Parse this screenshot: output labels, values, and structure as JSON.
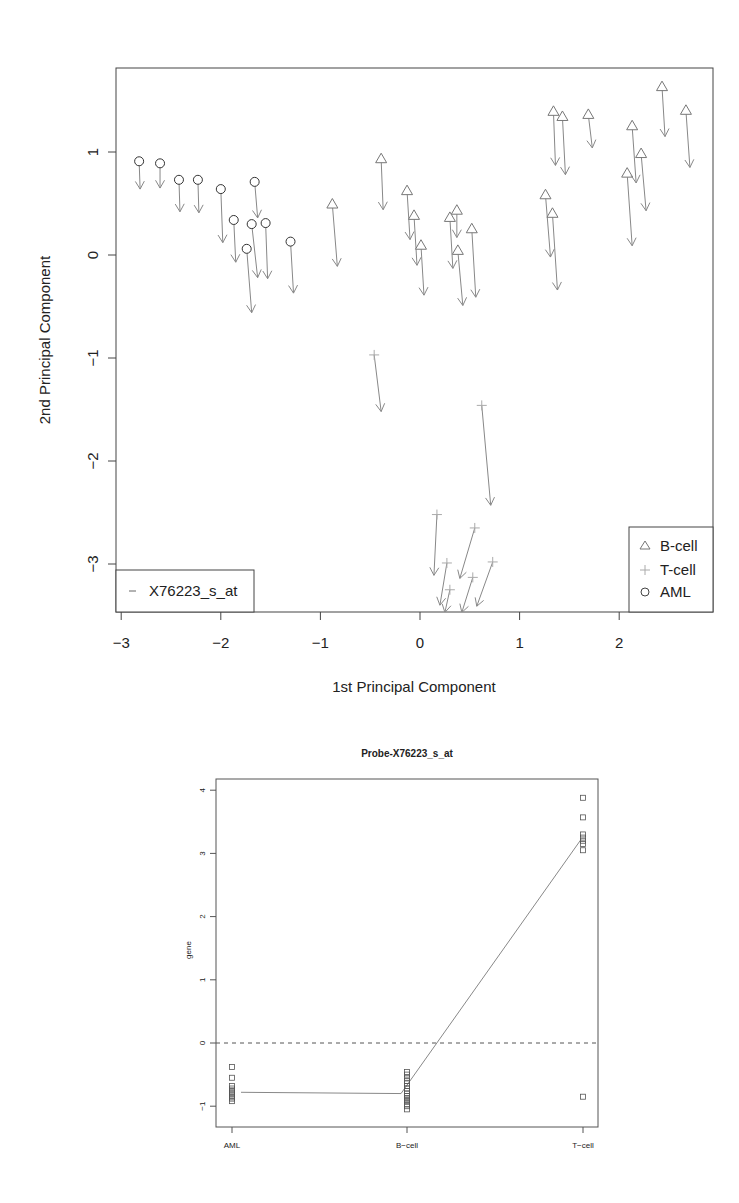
{
  "chart_data": [
    {
      "type": "scatter",
      "subtype": "arrow-displacement",
      "title": "",
      "xlabel": "1st Principal Component",
      "ylabel": "2nd Principal Component",
      "xlim": [
        -3.05,
        2.95
      ],
      "ylim": [
        -3.47,
        1.83
      ],
      "xticks": [
        -3,
        -2,
        -1,
        0,
        1,
        2
      ],
      "yticks": [
        1,
        0,
        -1,
        -2,
        -3
      ],
      "grid": false,
      "legends": [
        {
          "placement": "bottom-right",
          "entries": [
            {
              "label": "B-cell",
              "marker": "triangle"
            },
            {
              "label": "T-cell",
              "marker": "plus"
            },
            {
              "label": "AML",
              "marker": "circle"
            }
          ]
        },
        {
          "placement": "bottom-left",
          "entries": [
            {
              "label": "X76223_s_at",
              "marker": "dash"
            }
          ]
        }
      ],
      "series": [
        {
          "name": "AML",
          "marker": "circle",
          "points": [
            {
              "x": -2.82,
              "y": 0.91,
              "x2": -2.81,
              "y2": 0.64
            },
            {
              "x": -2.61,
              "y": 0.89,
              "x2": -2.61,
              "y2": 0.65
            },
            {
              "x": -2.42,
              "y": 0.73,
              "x2": -2.41,
              "y2": 0.42
            },
            {
              "x": -2.23,
              "y": 0.73,
              "x2": -2.22,
              "y2": 0.41
            },
            {
              "x": -2.0,
              "y": 0.64,
              "x2": -1.98,
              "y2": 0.12
            },
            {
              "x": -1.87,
              "y": 0.34,
              "x2": -1.85,
              "y2": -0.07
            },
            {
              "x": -1.66,
              "y": 0.71,
              "x2": -1.63,
              "y2": 0.36
            },
            {
              "x": -1.69,
              "y": 0.3,
              "x2": -1.63,
              "y2": -0.22
            },
            {
              "x": -1.55,
              "y": 0.31,
              "x2": -1.53,
              "y2": -0.23
            },
            {
              "x": -1.74,
              "y": 0.06,
              "x2": -1.69,
              "y2": -0.56
            },
            {
              "x": -1.3,
              "y": 0.13,
              "x2": -1.27,
              "y2": -0.37
            }
          ]
        },
        {
          "name": "B-cell",
          "marker": "triangle",
          "points": [
            {
              "x": -0.88,
              "y": 0.49,
              "x2": -0.83,
              "y2": -0.11
            },
            {
              "x": -0.39,
              "y": 0.93,
              "x2": -0.37,
              "y2": 0.44
            },
            {
              "x": -0.13,
              "y": 0.62,
              "x2": -0.1,
              "y2": 0.15
            },
            {
              "x": -0.06,
              "y": 0.38,
              "x2": -0.03,
              "y2": -0.1
            },
            {
              "x": 0.01,
              "y": 0.09,
              "x2": 0.04,
              "y2": -0.39
            },
            {
              "x": 0.3,
              "y": 0.36,
              "x2": 0.33,
              "y2": -0.13
            },
            {
              "x": 0.37,
              "y": 0.43,
              "x2": 0.37,
              "y2": 0.17
            },
            {
              "x": 0.38,
              "y": 0.04,
              "x2": 0.43,
              "y2": -0.49
            },
            {
              "x": 0.52,
              "y": 0.25,
              "x2": 0.56,
              "y2": -0.41
            },
            {
              "x": 1.34,
              "y": 1.39,
              "x2": 1.36,
              "y2": 0.87
            },
            {
              "x": 1.43,
              "y": 1.34,
              "x2": 1.46,
              "y2": 0.78
            },
            {
              "x": 1.69,
              "y": 1.36,
              "x2": 1.73,
              "y2": 1.04
            },
            {
              "x": 1.26,
              "y": 0.58,
              "x2": 1.31,
              "y2": -0.02
            },
            {
              "x": 1.33,
              "y": 0.4,
              "x2": 1.38,
              "y2": -0.34
            },
            {
              "x": 2.08,
              "y": 0.79,
              "x2": 2.13,
              "y2": 0.09
            },
            {
              "x": 2.13,
              "y": 1.25,
              "x2": 2.17,
              "y2": 0.7
            },
            {
              "x": 2.22,
              "y": 0.98,
              "x2": 2.27,
              "y2": 0.43
            },
            {
              "x": 2.43,
              "y": 1.63,
              "x2": 2.46,
              "y2": 1.15
            },
            {
              "x": 2.67,
              "y": 1.4,
              "x2": 2.71,
              "y2": 0.85
            }
          ]
        },
        {
          "name": "T-cell",
          "marker": "plus",
          "points": [
            {
              "x": -0.46,
              "y": -0.97,
              "x2": -0.39,
              "y2": -1.52
            },
            {
              "x": 0.62,
              "y": -1.46,
              "x2": 0.71,
              "y2": -2.43
            },
            {
              "x": 0.17,
              "y": -2.52,
              "x2": 0.14,
              "y2": -3.11
            },
            {
              "x": 0.27,
              "y": -2.99,
              "x2": 0.2,
              "y2": -3.4
            },
            {
              "x": 0.55,
              "y": -2.65,
              "x2": 0.4,
              "y2": -3.14
            },
            {
              "x": 0.73,
              "y": -2.98,
              "x2": 0.57,
              "y2": -3.41
            },
            {
              "x": 0.3,
              "y": -3.25,
              "x2": 0.25,
              "y2": -3.47
            },
            {
              "x": 0.53,
              "y": -3.13,
              "x2": 0.42,
              "y2": -3.47
            }
          ]
        }
      ]
    },
    {
      "type": "scatter",
      "subtype": "strip-with-mean-line",
      "title": "Probe-X76223_s_at",
      "xlabel": "",
      "ylabel": "gene",
      "categories": [
        "AML",
        "B-cell",
        "T-cell"
      ],
      "ylim": [
        -1.25,
        4.15
      ],
      "yticks": [
        4,
        3,
        2,
        1,
        0,
        -1
      ],
      "grid": false,
      "reference_line": {
        "y": 0,
        "style": "dashed"
      },
      "means": [
        -0.78,
        -0.8,
        3.22
      ],
      "series": [
        {
          "name": "AML",
          "values": [
            -0.38,
            -0.55,
            -0.68,
            -0.72,
            -0.75,
            -0.78,
            -0.8,
            -0.83,
            -0.86,
            -0.88,
            -0.92
          ]
        },
        {
          "name": "B-cell",
          "values": [
            -0.46,
            -0.5,
            -0.55,
            -0.6,
            -0.64,
            -0.68,
            -0.72,
            -0.76,
            -0.8,
            -0.84,
            -0.87,
            -0.9,
            -0.93,
            -0.97,
            -1.0,
            -1.05
          ]
        },
        {
          "name": "T-cell",
          "values": [
            3.88,
            3.57,
            3.3,
            3.25,
            3.2,
            3.15,
            3.05,
            -0.85
          ]
        }
      ]
    }
  ]
}
